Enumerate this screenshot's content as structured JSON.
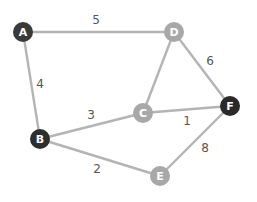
{
  "graph": {
    "nodes": [
      {
        "id": "A",
        "label": "A",
        "x": 23,
        "y": 32,
        "fill": "#3a3a3a"
      },
      {
        "id": "D",
        "label": "D",
        "x": 174,
        "y": 32,
        "fill": "#a8a8a8"
      },
      {
        "id": "B",
        "label": "B",
        "x": 40,
        "y": 139,
        "fill": "#2e2e2e"
      },
      {
        "id": "C",
        "label": "C",
        "x": 143,
        "y": 113,
        "fill": "#a8a8a8"
      },
      {
        "id": "F",
        "label": "F",
        "x": 230,
        "y": 106,
        "fill": "#2a2a2a"
      },
      {
        "id": "E",
        "label": "E",
        "x": 160,
        "y": 176,
        "fill": "#a8a8a8"
      }
    ],
    "edges": [
      {
        "from": "A",
        "to": "D",
        "weight": "5",
        "lx": 96,
        "ly": 24
      },
      {
        "from": "A",
        "to": "B",
        "weight": "4",
        "lx": 40,
        "ly": 87
      },
      {
        "from": "D",
        "to": "C",
        "weight": "",
        "lx": 0,
        "ly": 0
      },
      {
        "from": "D",
        "to": "F",
        "weight": "6",
        "lx": 210,
        "ly": 64
      },
      {
        "from": "B",
        "to": "C",
        "weight": "3",
        "lx": 91,
        "ly": 118
      },
      {
        "from": "C",
        "to": "F",
        "weight": "1",
        "lx": 187,
        "ly": 124
      },
      {
        "from": "B",
        "to": "E",
        "weight": "2",
        "lx": 97,
        "ly": 172
      },
      {
        "from": "E",
        "to": "F",
        "weight": "8",
        "lx": 205,
        "ly": 151
      }
    ]
  }
}
